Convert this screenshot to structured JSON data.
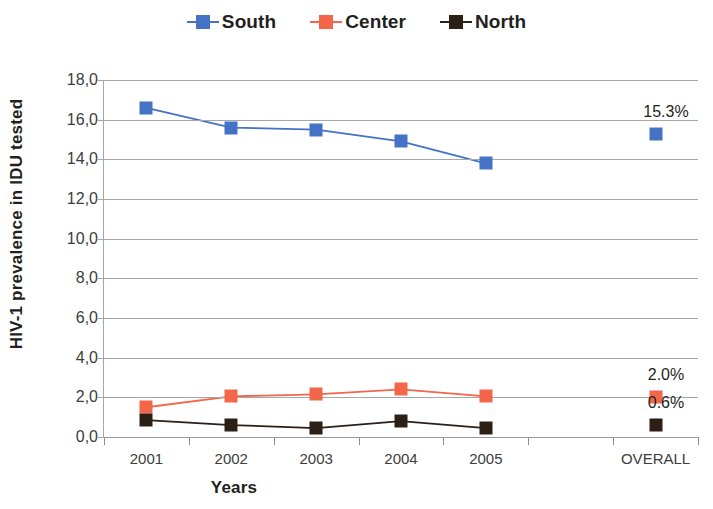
{
  "chart_data": {
    "type": "line",
    "title": "",
    "xlabel": "Years",
    "ylabel": "HIV-1 prevalence in IDU tested",
    "categories": [
      "2001",
      "2002",
      "2003",
      "2004",
      "2005",
      "",
      "OVERALL"
    ],
    "ylim": [
      0,
      18
    ],
    "ytick_labels": [
      "18,0",
      "16,0",
      "14,0",
      "12,0",
      "10,0",
      "8,0",
      "6,0",
      "4,0",
      "2,0",
      "0,0"
    ],
    "ytick_values": [
      18,
      16,
      14,
      12,
      10,
      8,
      6,
      4,
      2,
      0
    ],
    "grid": true,
    "legend_position": "top-center",
    "series": [
      {
        "name": "South",
        "color": "#4472c4",
        "values": [
          16.6,
          15.6,
          15.5,
          14.9,
          13.8,
          null,
          15.3
        ],
        "end_label": "15.3%"
      },
      {
        "name": "Center",
        "color": "#f4664a",
        "values": [
          1.5,
          2.05,
          2.15,
          2.4,
          2.05,
          null,
          2.0
        ],
        "end_label": "2.0%"
      },
      {
        "name": "North",
        "color": "#2b1f16",
        "values": [
          0.85,
          0.6,
          0.45,
          0.8,
          0.45,
          null,
          0.6
        ],
        "end_label": "0.6%"
      }
    ]
  },
  "legend": {
    "items": [
      {
        "label": "South"
      },
      {
        "label": "Center"
      },
      {
        "label": "North"
      }
    ]
  },
  "axes": {
    "y_title": "HIV-1 prevalence in IDU tested",
    "x_title": "Years"
  }
}
